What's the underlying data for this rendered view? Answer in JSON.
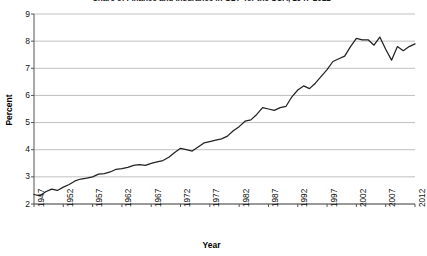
{
  "chart_data": {
    "type": "line",
    "title": "Share of Finance and Insurance in GDP for the USA, 1947-2012",
    "xlabel": "Year",
    "ylabel": "Percent",
    "ylim": [
      2,
      9
    ],
    "xlim": [
      1947,
      2012
    ],
    "grid": true,
    "legend": "none",
    "y_ticks": [
      9,
      8,
      7,
      6,
      5,
      4,
      3,
      2
    ],
    "x_ticks": [
      1947,
      1952,
      1957,
      1962,
      1967,
      1972,
      1977,
      1982,
      1987,
      1992,
      1997,
      2002,
      2007,
      2012
    ],
    "line_color": "#222222",
    "grid_color": "#b9b9b9",
    "series": [
      {
        "name": "Finance and Insurance share of GDP",
        "x": [
          1947,
          1948,
          1949,
          1950,
          1951,
          1952,
          1953,
          1954,
          1955,
          1956,
          1957,
          1958,
          1959,
          1960,
          1961,
          1962,
          1963,
          1964,
          1965,
          1966,
          1967,
          1968,
          1969,
          1970,
          1971,
          1972,
          1973,
          1974,
          1975,
          1976,
          1977,
          1978,
          1979,
          1980,
          1981,
          1982,
          1983,
          1984,
          1985,
          1986,
          1987,
          1988,
          1989,
          1990,
          1991,
          1992,
          1993,
          1994,
          1995,
          1996,
          1997,
          1998,
          1999,
          2000,
          2001,
          2002,
          2003,
          2004,
          2005,
          2006,
          2007,
          2008,
          2009,
          2010,
          2011,
          2012
        ],
        "values": [
          2.35,
          2.3,
          2.45,
          2.55,
          2.5,
          2.62,
          2.72,
          2.85,
          2.92,
          2.95,
          3.0,
          3.1,
          3.12,
          3.18,
          3.28,
          3.3,
          3.35,
          3.42,
          3.45,
          3.42,
          3.5,
          3.55,
          3.6,
          3.72,
          3.9,
          4.05,
          4.0,
          3.95,
          4.1,
          4.25,
          4.3,
          4.35,
          4.4,
          4.5,
          4.7,
          4.85,
          5.05,
          5.1,
          5.3,
          5.55,
          5.5,
          5.45,
          5.55,
          5.6,
          5.95,
          6.2,
          6.35,
          6.25,
          6.45,
          6.7,
          6.95,
          7.25,
          7.35,
          7.45,
          7.8,
          8.1,
          8.05,
          8.05,
          7.85,
          8.15,
          7.7,
          7.3,
          7.8,
          7.65,
          7.8,
          7.9
        ]
      }
    ]
  }
}
